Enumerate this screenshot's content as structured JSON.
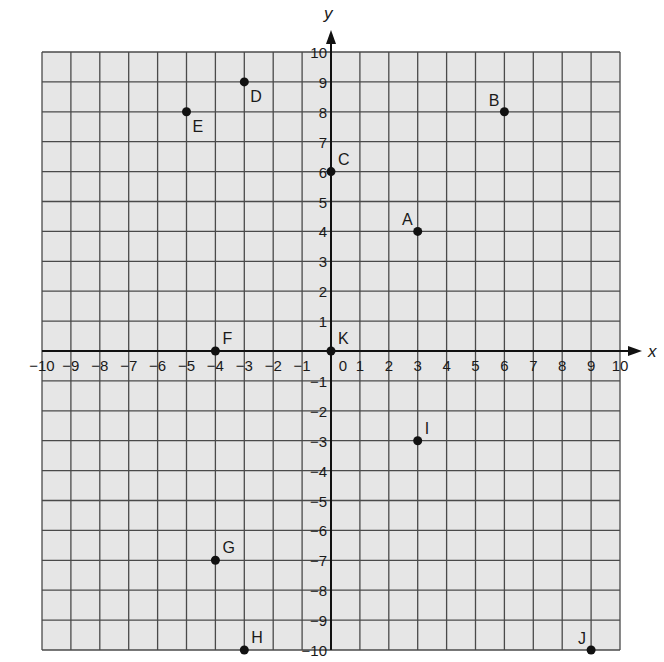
{
  "chart_data": {
    "type": "scatter",
    "title": "",
    "xlabel": "x",
    "ylabel": "y",
    "xlim": [
      -10,
      10
    ],
    "ylim": [
      -10,
      10
    ],
    "grid": true,
    "legend": null,
    "x_ticks": [
      -10,
      -9,
      -8,
      -7,
      -6,
      -5,
      -4,
      -3,
      -2,
      -1,
      0,
      1,
      2,
      3,
      4,
      5,
      6,
      7,
      8,
      9,
      10
    ],
    "y_ticks": [
      -10,
      -9,
      -8,
      -7,
      -6,
      -5,
      -4,
      -3,
      -2,
      -1,
      0,
      1,
      2,
      3,
      4,
      5,
      6,
      7,
      8,
      9,
      10
    ],
    "x_tick_labels": [
      "−10",
      "−9",
      "−8",
      "−7",
      "−6",
      "−5",
      "−4",
      "−3",
      "−2",
      "−1",
      "0",
      "1",
      "2",
      "3",
      "4",
      "5",
      "6",
      "7",
      "8",
      "9",
      "10"
    ],
    "y_tick_labels": [
      "−10",
      "−9",
      "−8",
      "−7",
      "−6",
      "−5",
      "−4",
      "−3",
      "−2",
      "−1",
      "",
      "1",
      "2",
      "3",
      "4",
      "5",
      "6",
      "7",
      "8",
      "9",
      "10"
    ],
    "points": [
      {
        "label": "A",
        "x": 3,
        "y": 4,
        "label_pos": "upper-left"
      },
      {
        "label": "B",
        "x": 6,
        "y": 8,
        "label_pos": "upper-left"
      },
      {
        "label": "C",
        "x": 0,
        "y": 6,
        "label_pos": "upper-right"
      },
      {
        "label": "D",
        "x": -3,
        "y": 9,
        "label_pos": "lower-right"
      },
      {
        "label": "E",
        "x": -5,
        "y": 8,
        "label_pos": "lower-right"
      },
      {
        "label": "F",
        "x": -4,
        "y": 0,
        "label_pos": "upper-right"
      },
      {
        "label": "G",
        "x": -4,
        "y": -7,
        "label_pos": "upper-right"
      },
      {
        "label": "H",
        "x": -3,
        "y": -10,
        "label_pos": "upper-right"
      },
      {
        "label": "I",
        "x": 3,
        "y": -3,
        "label_pos": "upper-right"
      },
      {
        "label": "J",
        "x": 9,
        "y": -10,
        "label_pos": "upper-left"
      },
      {
        "label": "K",
        "x": 0,
        "y": 0,
        "label_pos": "upper-right"
      }
    ],
    "colors": {
      "grid_bg": "#e6e6e6",
      "grid_line": "#4a4a4a",
      "axis": "#111111",
      "point": "#111111"
    }
  }
}
